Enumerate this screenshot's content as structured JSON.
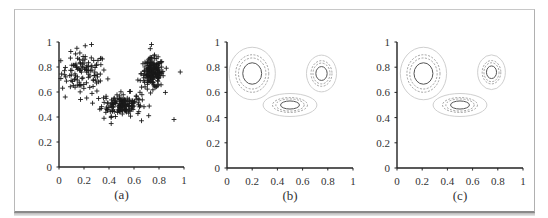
{
  "chart_data": [
    {
      "id": "a",
      "type": "scatter",
      "panel_label": "(a)",
      "title": "",
      "xlabel": "(a)",
      "ylabel": "",
      "xlim": [
        0,
        1
      ],
      "ylim": [
        0,
        1
      ],
      "x_ticks": [
        "0",
        "0.2",
        "0.4",
        "0.6",
        "0.8",
        "1"
      ],
      "y_ticks": [
        "0",
        "0.2",
        "0.4",
        "0.6",
        "0.8",
        "1"
      ],
      "marker": "+",
      "grid": false,
      "clusters": [
        {
          "name": "cluster-1",
          "center": [
            0.2,
            0.75
          ],
          "spread": [
            0.09,
            0.08
          ],
          "n": 110
        },
        {
          "name": "cluster-2",
          "center": [
            0.5,
            0.5
          ],
          "spread": [
            0.08,
            0.045
          ],
          "n": 160
        },
        {
          "name": "cluster-3",
          "center": [
            0.75,
            0.75
          ],
          "spread": [
            0.045,
            0.06
          ],
          "n": 190
        }
      ],
      "outliers": [
        [
          0.92,
          0.38
        ],
        [
          0.74,
          0.98
        ],
        [
          0.97,
          0.76
        ],
        [
          0.66,
          0.37
        ],
        [
          0.26,
          0.98
        ],
        [
          0.21,
          0.97
        ],
        [
          0.05,
          0.56
        ],
        [
          0.36,
          0.39
        ]
      ]
    },
    {
      "id": "b",
      "type": "contour",
      "panel_label": "(b)",
      "xlabel": "(b)",
      "xlim": [
        0,
        1
      ],
      "ylim": [
        0,
        1
      ],
      "x_ticks": [
        "0",
        "0.2",
        "0.4",
        "0.6",
        "0.8",
        "1"
      ],
      "y_ticks": [
        "0",
        "0.2",
        "0.4",
        "0.6",
        "0.8",
        "1"
      ],
      "components": [
        {
          "center": [
            0.2,
            0.75
          ],
          "radii": [
            0.075,
            0.085
          ],
          "scales": [
            1.0,
            1.45,
            1.75,
            2.45
          ]
        },
        {
          "center": [
            0.5,
            0.5
          ],
          "radii": [
            0.075,
            0.032
          ],
          "scales": [
            1.0,
            1.5,
            1.85,
            2.85
          ]
        },
        {
          "center": [
            0.75,
            0.75
          ],
          "radii": [
            0.045,
            0.055
          ],
          "scales": [
            1.0,
            1.5,
            1.85,
            2.65
          ]
        }
      ]
    },
    {
      "id": "c",
      "type": "contour",
      "panel_label": "(c)",
      "xlabel": "(c)",
      "xlim": [
        0,
        1
      ],
      "ylim": [
        0,
        1
      ],
      "x_ticks": [
        "0",
        "0.2",
        "0.4",
        "0.6",
        "0.8",
        "1"
      ],
      "y_ticks": [
        "0",
        "0.2",
        "0.4",
        "0.6",
        "0.8",
        "1"
      ],
      "components": [
        {
          "center": [
            0.21,
            0.75
          ],
          "radii": [
            0.075,
            0.085
          ],
          "scales": [
            1.0,
            1.45,
            1.75,
            2.45
          ]
        },
        {
          "center": [
            0.5,
            0.5
          ],
          "radii": [
            0.075,
            0.032
          ],
          "scales": [
            1.0,
            1.5,
            1.85,
            2.85
          ]
        },
        {
          "center": [
            0.75,
            0.76
          ],
          "radii": [
            0.04,
            0.05
          ],
          "scales": [
            1.0,
            1.5,
            1.85,
            2.75
          ]
        }
      ]
    }
  ],
  "colors": {
    "axis": "#222222",
    "marker": "#1a1a1a",
    "contour_inner": "#555555",
    "contour_dashed": "#8a8a8a",
    "contour_outer": "#cfcfcf"
  }
}
